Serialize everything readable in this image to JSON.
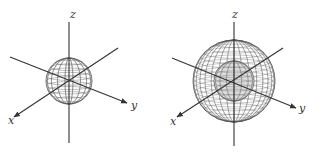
{
  "figures": [
    {
      "id": "small-sphere",
      "center": [
        69,
        81
      ],
      "outer_radius": 23,
      "inner_radius": 0,
      "labels": {
        "z": "z",
        "x": "x",
        "y": "y"
      },
      "axes": {
        "z": {
          "from": [
            69,
            22
          ],
          "to": [
            69,
            143
          ],
          "label_pos": [
            70,
            18
          ]
        },
        "y": {
          "from": [
            10,
            57
          ],
          "to": [
            127,
            103
          ],
          "label_pos": [
            131,
            109
          ]
        },
        "x": {
          "from": [
            118,
            48
          ],
          "to": [
            14,
            117
          ],
          "label_pos": [
            8,
            124
          ]
        }
      }
    },
    {
      "id": "large-sphere",
      "center": [
        234,
        81
      ],
      "outer_radius": 41,
      "inner_radius": 20,
      "labels": {
        "z": "z",
        "x": "x",
        "y": "y"
      },
      "axes": {
        "z": {
          "from": [
            234,
            22
          ],
          "to": [
            234,
            146
          ],
          "label_pos": [
            232,
            18
          ]
        },
        "y": {
          "from": [
            172,
            58
          ],
          "to": [
            296,
            108
          ],
          "label_pos": [
            299,
            112
          ]
        },
        "x": {
          "from": [
            283,
            48
          ],
          "to": [
            177,
            117
          ],
          "label_pos": [
            170,
            125
          ]
        }
      }
    }
  ],
  "colors": {
    "axis": "#333333",
    "mesh": "#555555",
    "inner_fill": "#9a9a9a",
    "background": "#ffffff"
  }
}
